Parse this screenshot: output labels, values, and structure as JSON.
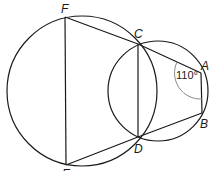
{
  "diagram": {
    "points": {
      "F": {
        "label": "F",
        "x": 65,
        "y": 17
      },
      "E": {
        "label": "E",
        "x": 66,
        "y": 165
      },
      "C": {
        "label": "C",
        "x": 138,
        "y": 44
      },
      "D": {
        "label": "D",
        "x": 138,
        "y": 137
      },
      "A": {
        "label": "A",
        "x": 201,
        "y": 73
      },
      "B": {
        "label": "B",
        "x": 202,
        "y": 113
      }
    },
    "circles": [
      {
        "name": "large-circle",
        "cx": 82,
        "cy": 91,
        "r": 75
      },
      {
        "name": "small-circle",
        "cx": 158,
        "cy": 91,
        "r": 50
      }
    ],
    "segments": [
      "FC",
      "CA",
      "AB",
      "BD",
      "DE",
      "EF",
      "CD"
    ],
    "angle": {
      "vertex": "A",
      "label": "110°",
      "value": 110
    },
    "colors": {
      "stroke": "#1a1a1a",
      "arc": "#8a8a8a",
      "background": "#ffffff"
    }
  }
}
